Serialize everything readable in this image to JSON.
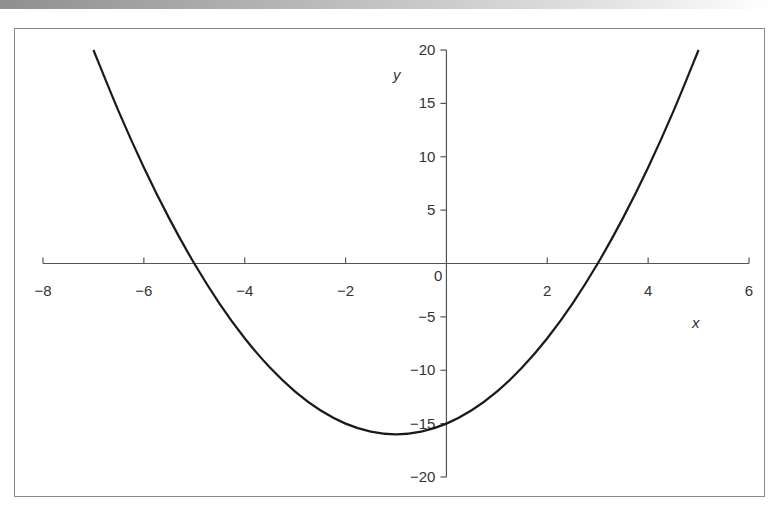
{
  "chart_data": {
    "type": "line",
    "title": "",
    "xlabel": "x",
    "ylabel": "y",
    "xlim": [
      -8,
      6
    ],
    "ylim": [
      -20,
      20
    ],
    "x_ticks": [
      -8,
      -6,
      -4,
      -2,
      0,
      2,
      4,
      6
    ],
    "x_tick_labels": [
      "−8",
      "−6",
      "−4",
      "−2",
      "0",
      "2",
      "4",
      "6"
    ],
    "y_ticks": [
      20,
      15,
      10,
      5,
      -5,
      -10,
      -15,
      -20
    ],
    "y_tick_labels": [
      "20",
      "15",
      "10",
      "5",
      "−5",
      "−10",
      "−15",
      "−20"
    ],
    "origin_label": "0",
    "grid": false,
    "legend": null,
    "series": [
      {
        "name": "y = x^2 + 2x - 15",
        "x": [
          -7,
          -6.5,
          -6,
          -5.5,
          -5,
          -4.5,
          -4,
          -3.5,
          -3,
          -2.5,
          -2,
          -1.5,
          -1,
          -0.5,
          0,
          0.5,
          1,
          1.5,
          2,
          2.5,
          3,
          3.5,
          4,
          4.5,
          5
        ],
        "values": [
          20,
          14.25,
          9,
          4.25,
          0,
          -3.75,
          -7,
          -9.75,
          -12,
          -13.75,
          -15,
          -15.75,
          -16,
          -15.75,
          -15,
          -13.75,
          -12,
          -9.75,
          -7,
          -3.75,
          0,
          4.25,
          9,
          14.25,
          20
        ]
      }
    ],
    "colors": {
      "curve": "#1a1a1a",
      "axis": "#555555",
      "frame": "#8a8a8a"
    }
  }
}
